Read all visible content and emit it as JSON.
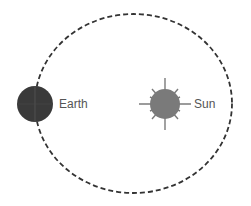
{
  "diagram": {
    "orbit": {
      "style": "dashed",
      "color": "#333333"
    },
    "earth": {
      "label": "Earth",
      "color": "#3a3a3a"
    },
    "sun": {
      "label": "Sun",
      "color": "#7a7a7a"
    }
  }
}
